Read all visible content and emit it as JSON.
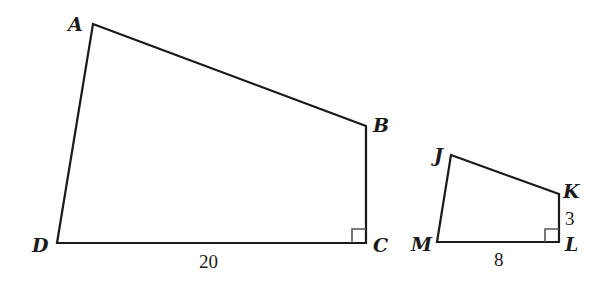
{
  "figure": {
    "large_quadrilateral": {
      "vertices": {
        "A": "A",
        "B": "B",
        "C": "C",
        "D": "D"
      },
      "side_DC_label": "20",
      "right_angle_at": "C"
    },
    "small_quadrilateral": {
      "vertices": {
        "J": "J",
        "K": "K",
        "L": "L",
        "M": "M"
      },
      "side_ML_label": "8",
      "side_KL_label": "3",
      "right_angle_at": "L"
    }
  }
}
